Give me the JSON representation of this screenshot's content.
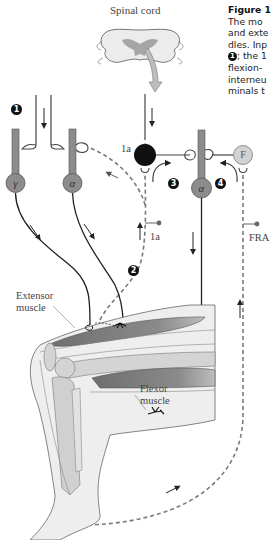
{
  "figure": {
    "caption_title": "Figure 1",
    "caption_lines": [
      "The mo",
      "and exte",
      "dles. Inp",
      "; the 1",
      "flexion-",
      "interneu",
      "minals t"
    ],
    "caption_badge_1": "1"
  },
  "labels": {
    "spinal_cord": "Spinal cord",
    "ia_interneuron": "1a",
    "ia_afferent": "1a",
    "fra": "FRA",
    "extensor_line1": "Extensor",
    "extensor_line2": "muscle",
    "flexor_line1": "Flexor",
    "flexor_line2": "muscle"
  },
  "cells": {
    "gamma": "γ",
    "alpha_extensor": "α",
    "alpha_flexor": "α",
    "flexion_interneuron": "F"
  },
  "badges": {
    "b1": "1",
    "b2": "2",
    "b3": "3",
    "b4": "4"
  },
  "colors": {
    "neuron_fill": "#8c8c8c",
    "ia_interneuron_fill": "#111111",
    "f_interneuron_fill": "#cfcfcf",
    "muscle_fill": "#7d7d7d",
    "bone_fill": "#d4d4d4",
    "skin_fill": "#eeeeee",
    "dashed_afferent": "#7a7a7a"
  }
}
